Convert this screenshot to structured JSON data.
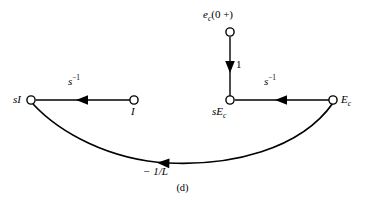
{
  "figure": {
    "caption": "(d)",
    "background_color": "#ffffff",
    "stroke_color": "#000000"
  },
  "nodes": [
    {
      "id": "sI",
      "label": "sI",
      "label_plain": "sI",
      "x": 31,
      "y": 100
    },
    {
      "id": "I",
      "label": "I",
      "label_plain": "I",
      "x": 134,
      "y": 100
    },
    {
      "id": "ec0",
      "label": "e_c(0 +)",
      "label_plain": "ec(0 +)",
      "x": 230,
      "y": 32
    },
    {
      "id": "sEc",
      "label": "sE_c",
      "label_plain": "sEc",
      "x": 230,
      "y": 100
    },
    {
      "id": "Ec",
      "label": "E_c",
      "label_plain": "Ec",
      "x": 333,
      "y": 100
    }
  ],
  "edges": [
    {
      "id": "sI-to-I",
      "from": "sI",
      "to": "I",
      "gain": "s^-1",
      "gain_plain": "s-1",
      "shape": "straight"
    },
    {
      "id": "ec0-to-sEc",
      "from": "ec0",
      "to": "sEc",
      "gain": "1",
      "gain_plain": "1",
      "shape": "straight"
    },
    {
      "id": "sEc-to-Ec",
      "from": "sEc",
      "to": "Ec",
      "gain": "s^-1",
      "gain_plain": "s-1",
      "shape": "straight"
    },
    {
      "id": "Ec-to-sI",
      "from": "Ec",
      "to": "sI",
      "gain": "-1/L",
      "gain_plain": "-1/L",
      "shape": "curved"
    }
  ],
  "labels": {
    "node_sI": "sI",
    "node_I": "I",
    "node_ec0_base": "e",
    "node_ec0_sub": "c",
    "node_ec0_arg": "(0 +)",
    "node_sEc_s": "sE",
    "node_sEc_sub": "c",
    "node_Ec_base": "E",
    "node_Ec_sub": "c",
    "gain_s_base": "s",
    "gain_s_exp": "−1",
    "gain_unity": "1",
    "gain_curve": "− 1/L"
  }
}
